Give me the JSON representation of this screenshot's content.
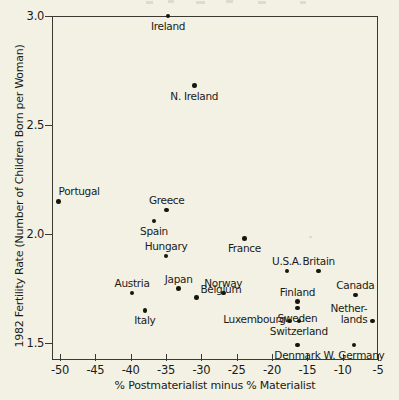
{
  "chart_data": {
    "type": "scatter",
    "title": "",
    "xlabel": "% Postmaterialist minus % Materialist",
    "ylabel": "1982 Fertility Rate (Number of Children Born per Woman)",
    "xlim": [
      -52,
      -4
    ],
    "ylim": [
      1.42,
      3.03
    ],
    "xticks": [
      "-50",
      "-45",
      "-40",
      "-35",
      "-30",
      "-25",
      "-20",
      "-15",
      "-10",
      "-5"
    ],
    "xtick_values": [
      -50,
      -45,
      -40,
      -35,
      -30,
      -25,
      -20,
      -15,
      -10,
      -5
    ],
    "yticks": [
      "1.5",
      "2.0",
      "2.5",
      "3.0"
    ],
    "ytick_values": [
      1.5,
      2.0,
      2.5,
      3.0
    ],
    "grid": false,
    "legend": null,
    "point_color": "#16160f",
    "frame_color": "#3a3a33",
    "background_color": "#f2f1e4",
    "points": [
      {
        "label": "Ireland",
        "x": -34.7,
        "y": 3.0,
        "label_pos": "below",
        "label_align": "c"
      },
      {
        "label": "N. Ireland",
        "x": -31.0,
        "y": 2.68,
        "label_pos": "below",
        "label_align": "c"
      },
      {
        "label": "Portugal",
        "x": -50.2,
        "y": 2.15,
        "label_pos": "above",
        "label_align": "l"
      },
      {
        "label": "Greece",
        "x": -34.9,
        "y": 2.11,
        "label_pos": "above",
        "label_align": "c"
      },
      {
        "label": "Spain",
        "x": -36.7,
        "y": 2.06,
        "label_pos": "below",
        "label_align": "c"
      },
      {
        "label": "France",
        "x": -23.9,
        "y": 1.98,
        "label_pos": "below",
        "label_align": "c"
      },
      {
        "label": "Hungary",
        "x": -35.0,
        "y": 1.9,
        "label_pos": "above",
        "label_align": "c"
      },
      {
        "label": "U.S.A.",
        "x": -17.9,
        "y": 1.83,
        "label_pos": "above",
        "label_align": "c"
      },
      {
        "label": "Britain",
        "x": -13.4,
        "y": 1.83,
        "label_pos": "above",
        "label_align": "c"
      },
      {
        "label": "Japan",
        "x": -33.2,
        "y": 1.75,
        "label_pos": "above",
        "label_align": "c"
      },
      {
        "label": "Austria",
        "x": -39.8,
        "y": 1.73,
        "label_pos": "above",
        "label_align": "c"
      },
      {
        "label": "Norway",
        "x": -26.9,
        "y": 1.73,
        "label_pos": "above",
        "label_align": "c"
      },
      {
        "label": "Canada",
        "x": -8.2,
        "y": 1.72,
        "label_pos": "above",
        "label_align": "c"
      },
      {
        "label": "Belgium",
        "x": -30.7,
        "y": 1.71,
        "label_pos": "above-right",
        "label_align": "l"
      },
      {
        "label": "Finland",
        "x": -16.4,
        "y": 1.69,
        "label_pos": "above",
        "label_align": "c"
      },
      {
        "label": "Sweden",
        "x": -16.4,
        "y": 1.66,
        "label_pos": "below",
        "label_align": "c"
      },
      {
        "label": "Italy",
        "x": -38.0,
        "y": 1.65,
        "label_pos": "below",
        "label_align": "c"
      },
      {
        "label": "Netherlands",
        "x": -5.8,
        "y": 1.6,
        "label_pos": "left-two",
        "label_align": "r"
      },
      {
        "label": "Luxembourg",
        "x": -17.5,
        "y": 1.6,
        "label_pos": "left",
        "label_align": "r"
      },
      {
        "label": "Switzerland",
        "x": -16.2,
        "y": 1.6,
        "label_pos": "below",
        "label_align": "c"
      },
      {
        "label": "Denmark",
        "x": -16.4,
        "y": 1.49,
        "label_pos": "below",
        "label_align": "c"
      },
      {
        "label": "W. Germany",
        "x": -8.4,
        "y": 1.49,
        "label_pos": "below",
        "label_align": "c"
      }
    ],
    "netherlands_label_lines": [
      "Nether-",
      "lands"
    ]
  }
}
